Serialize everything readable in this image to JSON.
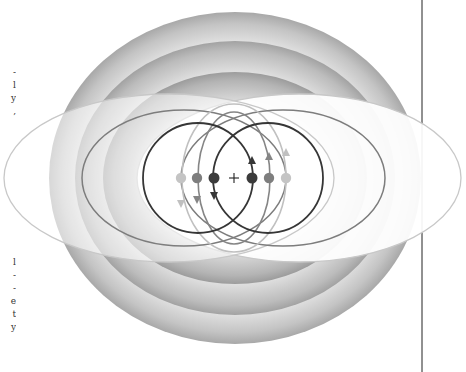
{
  "diagram": {
    "center_mark": "+",
    "colors": {
      "background": "#ffffff",
      "ring_gray_outer": "#b8b8b8",
      "ring_gray_mid": "#a9a9a9",
      "ring_gray_inner": "#9e9e9e",
      "circle_dark": "#3a3a3a",
      "circle_medium": "#7a7a7a",
      "circle_light": "#bdbdbd",
      "dot_dark": "#3b3b3b",
      "dot_medium": "#7e7e7e",
      "dot_light": "#c4c4c4",
      "divider": "#222222"
    },
    "dots": [
      {
        "name": "left-light-dot",
        "x": 181,
        "y": 178,
        "tone": "light"
      },
      {
        "name": "left-medium-dot",
        "x": 197,
        "y": 178,
        "tone": "medium"
      },
      {
        "name": "left-dark-dot",
        "x": 214,
        "y": 178,
        "tone": "dark"
      },
      {
        "name": "right-dark-dot",
        "x": 252,
        "y": 178,
        "tone": "dark"
      },
      {
        "name": "right-medium-dot",
        "x": 269,
        "y": 178,
        "tone": "medium"
      },
      {
        "name": "right-light-dot",
        "x": 286,
        "y": 178,
        "tone": "light"
      }
    ]
  },
  "margin_text_top": [
    "-",
    "l",
    "y",
    ","
  ],
  "margin_text_bottom": [
    "l",
    "-",
    "-",
    "e",
    "t",
    "y"
  ]
}
